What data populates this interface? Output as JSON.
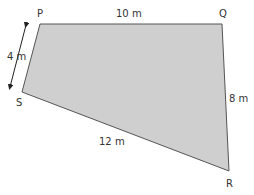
{
  "diagram": {
    "shape": "quadrilateral",
    "fill_color": "#cfcfcf",
    "stroke_color": "#555555",
    "vertices": {
      "P": {
        "label": "P",
        "x": 40,
        "y": 24
      },
      "Q": {
        "label": "Q",
        "x": 222,
        "y": 24
      },
      "R": {
        "label": "R",
        "x": 229,
        "y": 171
      },
      "S": {
        "label": "S",
        "x": 22,
        "y": 92
      }
    },
    "sides": {
      "PQ": "10 m",
      "QR": "8 m",
      "RS": "12 m",
      "SP": "4 m"
    }
  }
}
